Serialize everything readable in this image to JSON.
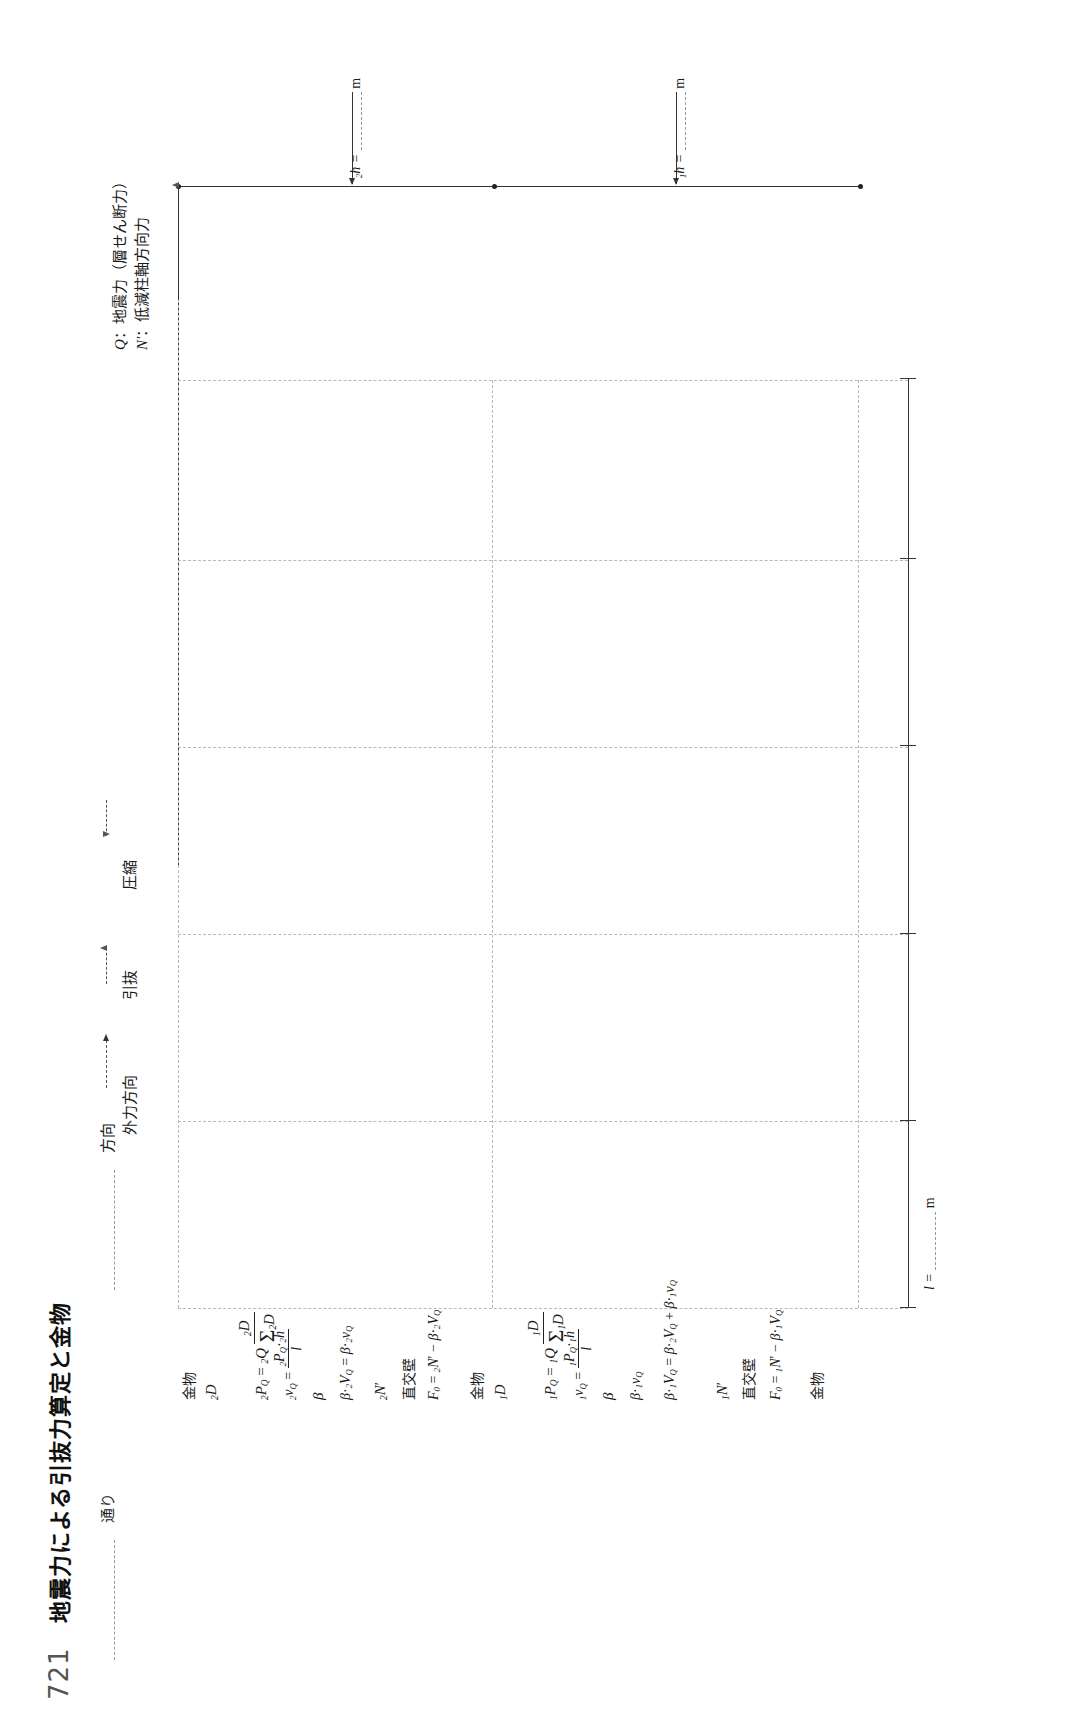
{
  "header": {
    "form_number": "721",
    "title": "地震力による引抜力算定と金物",
    "direction_field_label": "方向",
    "line_field_label": "通り"
  },
  "legend": {
    "items": [
      {
        "symbol": "Q",
        "separator": "：",
        "text": "地震力（層せん断力）"
      },
      {
        "symbol": "N′",
        "separator": "：",
        "text": "低減柱軸方向力"
      }
    ]
  },
  "direction_labels": {
    "external_force": "外力方向",
    "pullout": "引抜",
    "compression": "圧縮"
  },
  "elevation": {
    "story2": {
      "label_prefix": "2",
      "label": "h =",
      "unit": "m"
    },
    "story1": {
      "label_prefix": "1",
      "label": "h =",
      "unit": "m"
    }
  },
  "plan": {
    "span_label": "l =",
    "span_unit": "m"
  },
  "formula_rows": [
    {
      "id": "row-2f-hardware",
      "text": "金物"
    },
    {
      "id": "row-2f-D",
      "text": "₂D"
    },
    {
      "id": "row-2f-PQ",
      "text": "₂P_Q = ₂Q · ₂D / Σ₂D"
    },
    {
      "id": "row-2f-vQ",
      "text": "₂v_Q = ₂P_Q · ₂h / l"
    },
    {
      "id": "row-2f-beta",
      "text": "β"
    },
    {
      "id": "row-2f-betavQ",
      "text": "β · ₂v_Q = β · ₂v_Q"
    },
    {
      "id": "row-2f-Nprime",
      "text": "₂N′"
    },
    {
      "id": "row-2f-wall",
      "text": "直交壁"
    },
    {
      "id": "row-2f-F0",
      "text": "F₀ = ₂N′ − β · ₂V_Q"
    },
    {
      "id": "row-1f-hardware",
      "text": "金物"
    },
    {
      "id": "row-1f-D",
      "text": "₁D"
    },
    {
      "id": "row-1f-PQ",
      "text": "₁P_Q = ₁Q · ₁D / Σ₁D"
    },
    {
      "id": "row-1f-vQ",
      "text": "₁v_Q = ₁P_Q · ₁h / l"
    },
    {
      "id": "row-1f-beta",
      "text": "β"
    },
    {
      "id": "row-1f-betavQ",
      "text": "β · ₁v_Q"
    },
    {
      "id": "row-1f-sumV",
      "text": "β · ₁V_Q = β · ₂V_Q + β · ₁v_Q"
    },
    {
      "id": "row-1f-Nprime",
      "text": "₁N′"
    },
    {
      "id": "row-1f-wall",
      "text": "直交壁"
    },
    {
      "id": "row-1f-F0",
      "text": "F₀ = ₁N′ − β · ₁V_Q"
    }
  ],
  "formula_glyphs": {
    "hardware": "金物",
    "cross_wall": "直交壁",
    "D": "D",
    "Q": "Q",
    "P": "P",
    "v": "v",
    "V": "V",
    "N": "N",
    "F": "F",
    "h": "h",
    "l": "l",
    "beta": "β",
    "sigma": "Σ",
    "eq": "=",
    "minus": "−",
    "plus": "+",
    "cdot": "·",
    "prime": "′",
    "sub0": "0",
    "sub1": "1",
    "sub2": "2",
    "subQ": "Q"
  },
  "colors": {
    "ink": "#1a1a1a",
    "rule": "#333333",
    "grid_dashed": "#b9b9b9",
    "field_dashed": "#9a9a9a",
    "title_gray": "#555555"
  }
}
